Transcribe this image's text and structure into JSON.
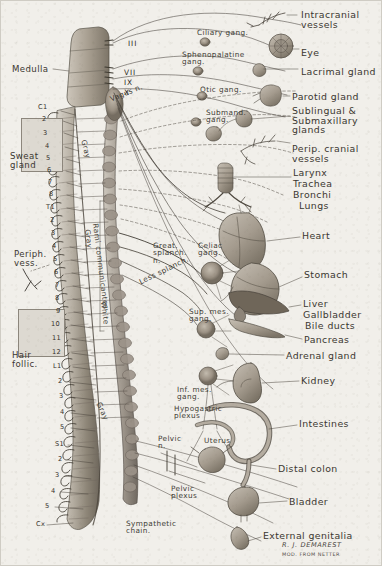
{
  "figure": {
    "background_color": "#f1efea",
    "ink_color": "#3b3731",
    "credit_artist": "R. J. DEMAREST",
    "credit_source": "MOD. FROM NETTER"
  },
  "left_labels": [
    {
      "name": "medulla",
      "text": "Medulla",
      "x": 11,
      "y": 64
    },
    {
      "name": "sweat-gland",
      "text": "Sweat\ngland",
      "x": 9,
      "y": 151
    },
    {
      "name": "peripheral-vessels",
      "text": "Periph.\nvess.",
      "x": 13,
      "y": 249
    },
    {
      "name": "hair-follicle",
      "text": "Hair\nfollic.",
      "x": 11,
      "y": 350
    }
  ],
  "cranial_nerves": [
    {
      "name": "cn-iii",
      "text": "III",
      "x": 127,
      "y": 39
    },
    {
      "name": "cn-vii",
      "text": "VII",
      "x": 123,
      "y": 68
    },
    {
      "name": "cn-ix",
      "text": "IX",
      "x": 123,
      "y": 78
    },
    {
      "name": "cn-x",
      "text": "X",
      "x": 123,
      "y": 88
    }
  ],
  "nerve_labels": [
    {
      "name": "vagus-nerve",
      "text": "Vagus n.",
      "x": 108,
      "y": 95,
      "rot": -22
    },
    {
      "name": "gray-upper",
      "text": "Gray",
      "x": 86,
      "y": 138,
      "rot": 76
    },
    {
      "name": "rami-communicantes",
      "text": "Rami communicantes",
      "x": 98,
      "y": 222,
      "rot": 83
    },
    {
      "name": "gray-mid",
      "text": "Gray",
      "x": 90,
      "y": 228,
      "rot": 83
    },
    {
      "name": "white-rami",
      "text": "White",
      "x": 106,
      "y": 300,
      "rot": 83
    },
    {
      "name": "gray-lower",
      "text": "Gray",
      "x": 101,
      "y": 400,
      "rot": 66
    },
    {
      "name": "greater-splanchnic",
      "text": "Great.\nsplanch.\nn.",
      "x": 152,
      "y": 241
    },
    {
      "name": "lesser-splanchnic",
      "text": "Less splanch.",
      "x": 137,
      "y": 278,
      "rot": -26
    },
    {
      "name": "celiac-ganglion",
      "text": "Celiac\ngang.",
      "x": 197,
      "y": 241
    },
    {
      "name": "superior-mesenteric-ganglion",
      "text": "Sup. mes.\ngang.",
      "x": 188,
      "y": 307
    },
    {
      "name": "inferior-mesenteric-ganglion",
      "text": "Inf. mes.\ngang.",
      "x": 176,
      "y": 385
    },
    {
      "name": "hypogastric-plexus",
      "text": "Hypogastric\nplexus",
      "x": 173,
      "y": 404
    },
    {
      "name": "pelvic-nerve",
      "text": "Pelvic\nn.",
      "x": 157,
      "y": 434
    },
    {
      "name": "pelvic-plexus",
      "text": "Pelvic\nplexus",
      "x": 170,
      "y": 484
    },
    {
      "name": "sympathetic-chain",
      "text": "Sympathetic\nchain.",
      "x": 125,
      "y": 519
    },
    {
      "name": "uterus",
      "text": "Uterus",
      "x": 203,
      "y": 436
    }
  ],
  "cranial_ganglia": [
    {
      "name": "ciliary-ganglion",
      "text": "Ciliary gang.",
      "x": 196,
      "y": 28
    },
    {
      "name": "sphenopalatine-ganglion",
      "text": "Sphenopalatine\ngang.",
      "x": 181,
      "y": 50
    },
    {
      "name": "otic-ganglion",
      "text": "Otic gang.",
      "x": 199,
      "y": 85
    },
    {
      "name": "submandibular-ganglion",
      "text": "Submand.\ngang.",
      "x": 205,
      "y": 108
    }
  ],
  "organ_labels": [
    {
      "name": "intracranial-vessels",
      "text": "Intracranial\nvessels",
      "x": 300,
      "y": 9
    },
    {
      "name": "eye",
      "text": "Eye",
      "x": 300,
      "y": 47
    },
    {
      "name": "lacrimal-gland",
      "text": "Lacrimal gland",
      "x": 300,
      "y": 66
    },
    {
      "name": "parotid-gland",
      "text": "Parotid gland",
      "x": 291,
      "y": 91
    },
    {
      "name": "sublingual-submaxillary-glands",
      "text": "Sublingual &\nSubmaxillary\nglands",
      "x": 291,
      "y": 105
    },
    {
      "name": "peripheral-cranial-vessels",
      "text": "Perip. cranial\nvessels",
      "x": 291,
      "y": 143
    },
    {
      "name": "larynx",
      "text": "Larynx",
      "x": 292,
      "y": 167
    },
    {
      "name": "trachea",
      "text": "Trachea",
      "x": 292,
      "y": 178
    },
    {
      "name": "bronchi",
      "text": "Bronchi",
      "x": 292,
      "y": 189
    },
    {
      "name": "lungs",
      "text": "Lungs",
      "x": 298,
      "y": 200
    },
    {
      "name": "heart",
      "text": "Heart",
      "x": 301,
      "y": 230
    },
    {
      "name": "stomach",
      "text": "Stomach",
      "x": 303,
      "y": 269
    },
    {
      "name": "liver",
      "text": "Liver",
      "x": 302,
      "y": 298
    },
    {
      "name": "gallbladder",
      "text": "Gallbladder",
      "x": 302,
      "y": 309
    },
    {
      "name": "bile-ducts",
      "text": "Bile ducts",
      "x": 304,
      "y": 320
    },
    {
      "name": "pancreas",
      "text": "Pancreas",
      "x": 303,
      "y": 334
    },
    {
      "name": "adrenal-gland",
      "text": "Adrenal gland",
      "x": 285,
      "y": 350
    },
    {
      "name": "kidney",
      "text": "Kidney",
      "x": 300,
      "y": 375
    },
    {
      "name": "intestines",
      "text": "Intestines",
      "x": 298,
      "y": 418
    },
    {
      "name": "distal-colon",
      "text": "Distal colon",
      "x": 277,
      "y": 463
    },
    {
      "name": "bladder",
      "text": "Bladder",
      "x": 288,
      "y": 496
    },
    {
      "name": "external-genitalia",
      "text": "External genitalia",
      "x": 262,
      "y": 530
    }
  ],
  "spinal_levels": [
    {
      "name": "level-c1",
      "text": "C1",
      "x": 37,
      "y": 103
    },
    {
      "name": "level-c2",
      "text": "2",
      "x": 41,
      "y": 115
    },
    {
      "name": "level-c3",
      "text": "3",
      "x": 42,
      "y": 129
    },
    {
      "name": "level-c4",
      "text": "4",
      "x": 44,
      "y": 142
    },
    {
      "name": "level-c5",
      "text": "5",
      "x": 45,
      "y": 154
    },
    {
      "name": "level-c6",
      "text": "6",
      "x": 46,
      "y": 166
    },
    {
      "name": "level-c7",
      "text": "7",
      "x": 47,
      "y": 178
    },
    {
      "name": "level-c8",
      "text": "8",
      "x": 48,
      "y": 190
    },
    {
      "name": "level-t1",
      "text": "T1",
      "x": 45,
      "y": 203
    },
    {
      "name": "level-t2",
      "text": "2",
      "x": 49,
      "y": 216
    },
    {
      "name": "level-t3",
      "text": "3",
      "x": 50,
      "y": 229
    },
    {
      "name": "level-t4",
      "text": "4",
      "x": 51,
      "y": 242
    },
    {
      "name": "level-t5",
      "text": "5",
      "x": 52,
      "y": 255
    },
    {
      "name": "level-t6",
      "text": "6",
      "x": 53,
      "y": 268
    },
    {
      "name": "level-t7",
      "text": "7",
      "x": 54,
      "y": 281
    },
    {
      "name": "level-t8",
      "text": "8",
      "x": 54,
      "y": 294
    },
    {
      "name": "level-t9",
      "text": "9",
      "x": 55,
      "y": 307
    },
    {
      "name": "level-t10",
      "text": "10",
      "x": 50,
      "y": 320
    },
    {
      "name": "level-t11",
      "text": "11",
      "x": 51,
      "y": 334
    },
    {
      "name": "level-t12",
      "text": "12",
      "x": 51,
      "y": 348
    },
    {
      "name": "level-l1",
      "text": "L1",
      "x": 52,
      "y": 362
    },
    {
      "name": "level-l2",
      "text": "2",
      "x": 57,
      "y": 377
    },
    {
      "name": "level-l3",
      "text": "3",
      "x": 58,
      "y": 392
    },
    {
      "name": "level-l4",
      "text": "4",
      "x": 59,
      "y": 408
    },
    {
      "name": "level-l5",
      "text": "5",
      "x": 59,
      "y": 423
    },
    {
      "name": "level-s1",
      "text": "S1",
      "x": 54,
      "y": 440
    },
    {
      "name": "level-s2",
      "text": "2",
      "x": 57,
      "y": 455
    },
    {
      "name": "level-s3",
      "text": "3",
      "x": 54,
      "y": 471
    },
    {
      "name": "level-s4",
      "text": "4",
      "x": 50,
      "y": 487
    },
    {
      "name": "level-s5",
      "text": "5",
      "x": 44,
      "y": 502
    },
    {
      "name": "level-cx",
      "text": "Cx",
      "x": 35,
      "y": 520
    }
  ]
}
